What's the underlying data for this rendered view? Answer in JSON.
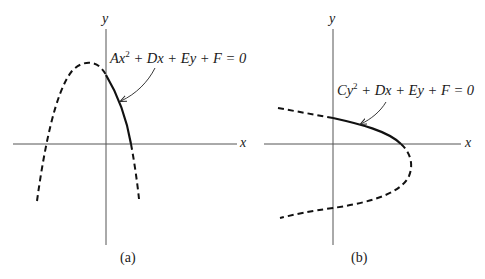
{
  "figure": {
    "panels": [
      {
        "id": "a",
        "sublabel": "(a)",
        "axis_x_label": "x",
        "axis_y_label": "y",
        "equation": {
          "coef1": "Ax",
          "exp": "2",
          "rest": " + Dx + Ey + F = 0"
        },
        "curve": "vertical parabola opening downward; solid segment in first quadrant, dashed elsewhere"
      },
      {
        "id": "b",
        "sublabel": "(b)",
        "axis_x_label": "x",
        "axis_y_label": "y",
        "equation": {
          "coef1": "Cy",
          "exp": "2",
          "rest": " + Dx + Ey + F = 0"
        },
        "curve": "horizontal parabola opening left; solid segment in first quadrant, dashed elsewhere"
      }
    ],
    "colors": {
      "curve": "#111111",
      "axis": "#555555",
      "text": "#1a1a1a"
    }
  }
}
